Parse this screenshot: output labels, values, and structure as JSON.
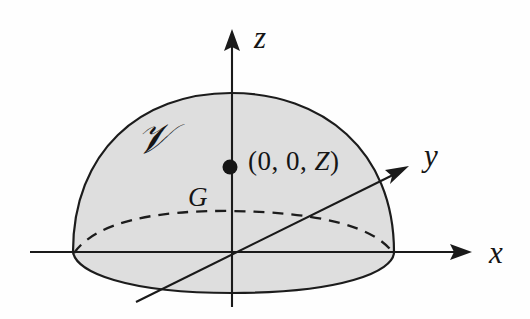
{
  "figure": {
    "kind": "geometry-diagram",
    "background_color": "#fefefe",
    "fill_color": "#dedede",
    "stroke_color": "#1c1c1c",
    "width": 530,
    "height": 319
  },
  "axes": {
    "x": {
      "label": "x",
      "start": [
        30,
        252
      ],
      "end": [
        470,
        252
      ],
      "arrow": "right"
    },
    "y": {
      "label": "y",
      "start": [
        136,
        302
      ],
      "end": [
        407,
        167
      ],
      "arrow": "up-right"
    },
    "z": {
      "label": "z",
      "start": [
        232,
        307
      ],
      "end": [
        232,
        30
      ],
      "arrow": "up"
    }
  },
  "labels": {
    "volume": "𝒱",
    "centroid": "G",
    "coordinates": "(0, 0, Z)",
    "coordinates_parts": {
      "open": "(0, 0, ",
      "variable": "Z",
      "close": ")"
    }
  },
  "marker": {
    "name": "centroid-point",
    "center": [
      230,
      167
    ],
    "radius": 7.5,
    "color": "#151515"
  },
  "dome": {
    "apex": [
      231,
      93
    ],
    "left_rim": [
      73,
      252
    ],
    "right_rim": [
      394,
      252
    ],
    "bottom": [
      232,
      293
    ],
    "hidden_arc_center_y": 212
  }
}
